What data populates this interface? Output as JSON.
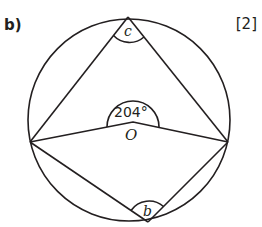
{
  "question": {
    "part_label": "b)",
    "marks": "[2]"
  },
  "diagram": {
    "center_label": "O",
    "reflex_angle_label": "204°",
    "angle_top_label": "c",
    "angle_bottom_label": "b",
    "stroke_color": "#231f20"
  }
}
